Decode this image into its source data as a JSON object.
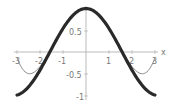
{
  "chart_data": {
    "type": "line",
    "title": "",
    "xlabel": "x",
    "ylabel": "",
    "xlim": [
      -3,
      3
    ],
    "ylim": [
      -1,
      1
    ],
    "grid": false,
    "legend": null,
    "x_ticks": [
      "-3",
      "-2",
      "-1",
      "1",
      "2",
      "3"
    ],
    "y_ticks": [
      "0.5",
      "-0.5",
      "-1"
    ],
    "series": [
      {
        "name": "cos(x)",
        "style": "thick dark",
        "color": "#2a2a2a",
        "x": [
          -3,
          -2.5,
          -2,
          -1.5,
          -1,
          -0.5,
          0,
          0.5,
          1,
          1.5,
          2,
          2.5,
          3
        ],
        "values": [
          -0.99,
          -0.8,
          -0.42,
          0.07,
          0.54,
          0.88,
          1.0,
          0.88,
          0.54,
          0.07,
          -0.42,
          -0.8,
          -0.99
        ]
      },
      {
        "name": "1 - x^2/2 + x^4/24",
        "style": "thin gray",
        "color": "#888888",
        "x": [
          -3,
          -2.5,
          -2,
          -1.5,
          -1,
          -0.5,
          0,
          0.5,
          1,
          1.5,
          2,
          2.5,
          3
        ],
        "values": [
          -0.13,
          -0.5,
          -0.33,
          0.09,
          0.54,
          0.88,
          1.0,
          0.88,
          0.54,
          0.09,
          -0.33,
          -0.5,
          -0.13
        ]
      }
    ]
  },
  "axes": {
    "x_label": "x",
    "x_tick_labels": [
      "-3",
      "-2",
      "-1",
      "1",
      "2",
      "3"
    ],
    "y_tick_labels": [
      "0.5",
      "-0.5",
      "-1"
    ]
  }
}
